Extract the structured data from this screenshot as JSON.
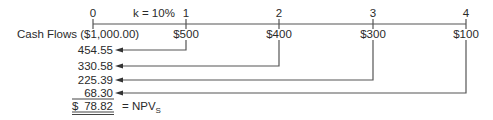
{
  "timeline": {
    "periods": [
      "0",
      "1",
      "2",
      "3",
      "4"
    ],
    "rate_label": "k = 10%",
    "row_label": "Cash Flows",
    "initial_outflow": "($1,000.00)",
    "cash_flows": [
      "$500",
      "$400",
      "$300",
      "$100"
    ]
  },
  "present_values": [
    "454.55",
    "330.58",
    "225.39",
    "68.30"
  ],
  "total": {
    "currency": "$",
    "value": "78.82",
    "label": "= NPV",
    "subscript": "S"
  },
  "colors": {
    "line": "#555555",
    "text": "#2a2a2a"
  }
}
